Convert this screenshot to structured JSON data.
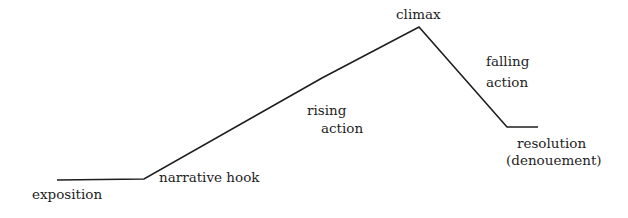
{
  "diagram": {
    "type": "plot-structure",
    "line_color": "#1e1e1e",
    "points": [
      {
        "x": 57,
        "y": 180
      },
      {
        "x": 144,
        "y": 179
      },
      {
        "x": 322,
        "y": 78
      },
      {
        "x": 419,
        "y": 27
      },
      {
        "x": 507,
        "y": 127
      },
      {
        "x": 538,
        "y": 127
      }
    ],
    "labels": {
      "exposition": "exposition",
      "narrative_hook": "narrative hook",
      "rising_action": {
        "line1": "rising",
        "line2": "action"
      },
      "climax": "climax",
      "falling_action": {
        "line1": "falling",
        "line2": "action"
      },
      "resolution": {
        "line1": "resolution",
        "line2": "(denouement)"
      }
    }
  }
}
